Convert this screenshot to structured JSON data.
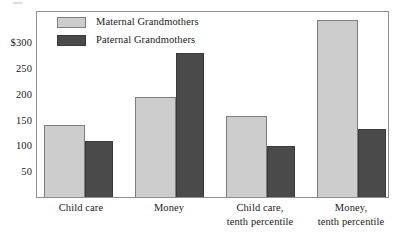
{
  "chart_data": {
    "type": "bar",
    "title": "",
    "subtitle": "",
    "xlabel": "",
    "ylabel": "",
    "categories": [
      "Child care",
      "Money",
      "Child care,\ntenth percentile",
      "Money,\ntenth percentile"
    ],
    "category_lines": [
      [
        "Child care"
      ],
      [
        "Money"
      ],
      [
        "Child care,",
        "tenth percentile"
      ],
      [
        "Money,",
        "tenth percentile"
      ]
    ],
    "series": [
      {
        "name": "Maternal Grandmothers",
        "color": "#cdcdcd",
        "values": [
          140,
          195,
          158,
          345
        ]
      },
      {
        "name": "Paternal Grandmothers",
        "color": "#4a4a4a",
        "values": [
          110,
          282,
          100,
          133
        ]
      }
    ],
    "ylim": [
      0,
      361
    ],
    "yticks": [
      50,
      100,
      150,
      200,
      250,
      300
    ],
    "ytick_labels": [
      "50",
      "100",
      "150",
      "200",
      "250",
      "$300"
    ],
    "grid": false,
    "legend_position": "top-left inside plot area"
  },
  "legend": {
    "entries": [
      {
        "label": "Maternal Grandmothers",
        "swatch_color": "#cdcdcd"
      },
      {
        "label": "Paternal Grandmothers",
        "swatch_color": "#4a4a4a"
      }
    ]
  },
  "axes": {
    "y_tick_labels": [
      "$300",
      "250",
      "200",
      "150",
      "100",
      "50"
    ],
    "x_tick_labels": [
      "Child care",
      "Money",
      "Child care, tenth percentile",
      "Money, tenth percentile"
    ]
  },
  "colors": {
    "maternal": "#cdcdcd",
    "paternal": "#4a4a4a",
    "frame": "#8d8d8d",
    "background": "#ffffff",
    "text": "#1a1a1a"
  }
}
